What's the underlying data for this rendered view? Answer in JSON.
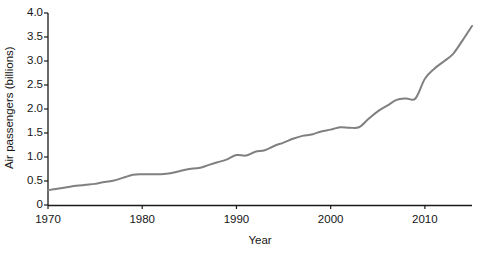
{
  "chart_data": {
    "type": "line",
    "title": "",
    "xlabel": "Year",
    "ylabel": "Air passengers (billions)",
    "xlim": [
      1970,
      2015
    ],
    "ylim": [
      0,
      4.0
    ],
    "grid": false,
    "legend": null,
    "line_color": "#808080",
    "line_width": 2,
    "xticks": [
      1970,
      1980,
      1990,
      2000,
      2010
    ],
    "xtick_labels": [
      "1970",
      "1980",
      "1990",
      "2000",
      "2010"
    ],
    "yticks": [
      0,
      0.5,
      1.0,
      1.5,
      2.0,
      2.5,
      3.0,
      3.5,
      4.0
    ],
    "ytick_labels": [
      "0",
      "0.5",
      "1.0",
      "1.5",
      "2.0",
      "2.5",
      "3.0",
      "3.5",
      "4.0"
    ],
    "series": [
      {
        "name": "Air passengers",
        "x": [
          1970,
          1971,
          1972,
          1973,
          1974,
          1975,
          1976,
          1977,
          1978,
          1979,
          1980,
          1981,
          1982,
          1983,
          1984,
          1985,
          1986,
          1987,
          1988,
          1989,
          1990,
          1991,
          1992,
          1993,
          1994,
          1995,
          1996,
          1997,
          1998,
          1999,
          2000,
          2001,
          2002,
          2003,
          2004,
          2005,
          2006,
          2007,
          2008,
          2009,
          2010,
          2011,
          2012,
          2013,
          2014,
          2015
        ],
        "values": [
          0.31,
          0.34,
          0.37,
          0.4,
          0.42,
          0.44,
          0.48,
          0.51,
          0.57,
          0.63,
          0.64,
          0.64,
          0.64,
          0.66,
          0.71,
          0.75,
          0.77,
          0.83,
          0.89,
          0.95,
          1.04,
          1.03,
          1.11,
          1.14,
          1.23,
          1.3,
          1.38,
          1.44,
          1.47,
          1.53,
          1.57,
          1.62,
          1.61,
          1.62,
          1.79,
          1.95,
          2.07,
          2.19,
          2.22,
          2.22,
          2.63,
          2.84,
          2.99,
          3.15,
          3.43,
          3.73
        ]
      }
    ]
  }
}
